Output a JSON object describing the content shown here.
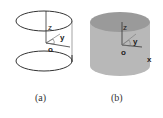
{
  "figure": {
    "panels": [
      {
        "id": "a",
        "caption": "(a)",
        "style": "wireframe",
        "axis_labels": {
          "z": "z",
          "y": "y",
          "origin": "o"
        },
        "description": "Two horizontal ellipses (top and bottom circles) with vertical z axis and origin o"
      },
      {
        "id": "b",
        "caption": "(b)",
        "style": "solid-cylinder",
        "axis_labels": {
          "z": "z",
          "y": "y",
          "x": "x",
          "origin": "o"
        },
        "description": "Solid gray cylinder with axes z, y, x from origin o"
      }
    ],
    "colors": {
      "line": "#333333",
      "cylinder_side": "#b8b8b8",
      "cylinder_top": "#9a9a9a",
      "background": "#ffffff"
    }
  }
}
